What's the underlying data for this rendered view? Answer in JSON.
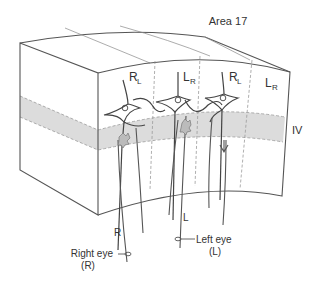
{
  "title": "Area 17",
  "layer_label": "IV",
  "columns": [
    {
      "main": "R",
      "sub": "L"
    },
    {
      "main": "L",
      "sub": "R"
    },
    {
      "main": "R",
      "sub": "L"
    },
    {
      "main": "L",
      "sub": "R"
    }
  ],
  "fiber_labels": {
    "right": "R",
    "left": "L"
  },
  "eyes": {
    "right": {
      "name": "Right eye",
      "abbr": "(R)"
    },
    "left": {
      "name": "Left eye",
      "abbr": "(L)"
    }
  },
  "colors": {
    "line": "#555555",
    "layer_fill": "#dcdcdc",
    "dash": "#9a9a9a",
    "text": "#333333"
  }
}
